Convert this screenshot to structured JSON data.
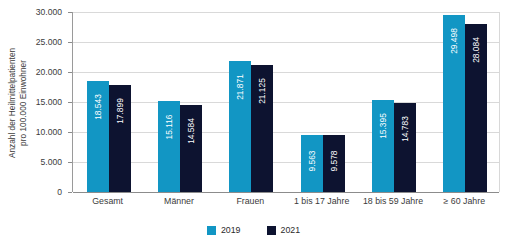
{
  "chart_data": {
    "type": "bar",
    "title": "",
    "xlabel": "",
    "ylabel": "Anzahl der Heilmittelpatienten pro 100.000 Einwohner",
    "ylabel_line1": "Anzahl der Heilmittelpatienten",
    "ylabel_line2": "pro 100.000 Einwohner",
    "categories": [
      "Gesamt",
      "Männer",
      "Frauen",
      "1 bis 17 Jahre",
      "18 bis 59 Jahre",
      "≥ 60 Jahre"
    ],
    "series": [
      {
        "name": "2019",
        "color": "#1296c4",
        "values": [
          18543,
          15116,
          21871,
          9563,
          15395,
          29498
        ],
        "labels": [
          "18.543",
          "15.116",
          "21.871",
          "9.563",
          "15.395",
          "29.498"
        ]
      },
      {
        "name": "2021",
        "color": "#0d1330",
        "values": [
          17899,
          14584,
          21125,
          9578,
          14783,
          28084
        ],
        "labels": [
          "17.899",
          "14.584",
          "21.125",
          "9.578",
          "14.783",
          "28.084"
        ]
      }
    ],
    "ylim": [
      0,
      30000
    ],
    "yticks": [
      0,
      5000,
      10000,
      15000,
      20000,
      25000,
      30000
    ],
    "ytick_labels": [
      "0",
      "5.000",
      "10.000",
      "15.000",
      "20.000",
      "25.000",
      "30.000"
    ],
    "grid": true,
    "legend_position": "bottom",
    "legend": [
      {
        "label": "2019",
        "color": "#1296c4"
      },
      {
        "label": "2021",
        "color": "#0d1330"
      }
    ]
  }
}
